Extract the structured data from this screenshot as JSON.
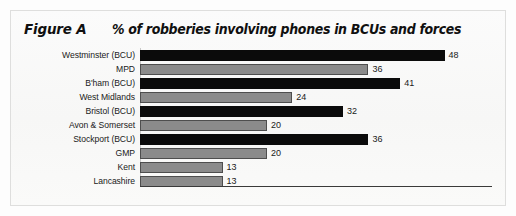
{
  "figure": {
    "tag": "Figure A",
    "title": "% of robberies involving phones in BCUs and forces"
  },
  "chart_data": {
    "type": "bar",
    "orientation": "horizontal",
    "title": "% of robberies involving phones in BCUs and forces",
    "xlabel": "",
    "ylabel": "",
    "xlim": [
      0,
      52
    ],
    "grid": false,
    "legend": "none",
    "value_suffix": "",
    "categories": [
      "Westminster (BCU)",
      "MPD",
      "B'ham (BCU)",
      "West Midlands",
      "Bristol (BCU)",
      "Avon & Somerset",
      "Stockport (BCU)",
      "GMP",
      "Kent",
      "Lancashire"
    ],
    "values": [
      48,
      36,
      41,
      24,
      32,
      20,
      36,
      20,
      13,
      13
    ],
    "value_labels": [
      "48",
      "36",
      "41",
      "24",
      "32",
      "20",
      "36",
      "20",
      "13",
      "13"
    ],
    "bar_styles": [
      "dark",
      "light",
      "dark",
      "light",
      "dark",
      "light",
      "dark",
      "light",
      "light",
      "light"
    ],
    "colors": {
      "dark_bar": "#0b0b0b",
      "light_bar": "#8b8b8b",
      "light_bar_border": "#4e4e4e",
      "text": "#1a1a1a",
      "axis": "#3a3a3a",
      "background": "#fafaf9"
    }
  }
}
